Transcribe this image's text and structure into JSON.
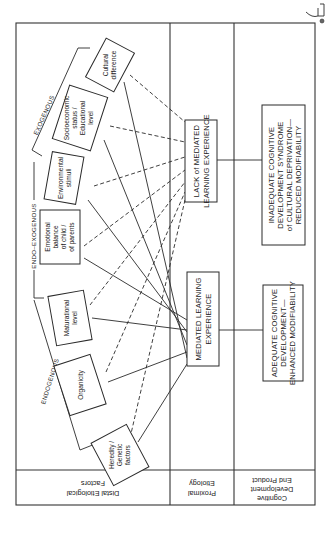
{
  "diagram": {
    "orientation": "rotated-90-clockwise",
    "row_headers": {
      "distal": "Distal Etiological Factors",
      "distal_line1": "Distal Etiological",
      "distal_line2": "Factors",
      "proximal_line1": "Proximal",
      "proximal_line2": "Etiology",
      "product_line1": "Cognitive",
      "product_line2": "Development",
      "product_line3": "End Product"
    },
    "groups": {
      "exogenous": "EXOGENOUS",
      "endo_exogenous": "ENDO–EXOGENOUS",
      "endogenous": "ENDOGENOUS"
    },
    "factors": [
      {
        "id": "cultural",
        "lines": [
          "Cultural",
          "difference"
        ],
        "group": "exogenous"
      },
      {
        "id": "socioeconomic",
        "lines": [
          "Socioeconomic",
          "status /",
          "Educational",
          "level"
        ],
        "group": "exogenous"
      },
      {
        "id": "environmental",
        "lines": [
          "Environmental",
          "stimuli"
        ],
        "group": "endo_exogenous"
      },
      {
        "id": "emotional",
        "lines": [
          "Emotional",
          "balance",
          "of child /",
          "of parents"
        ],
        "group": "endo_exogenous"
      },
      {
        "id": "maturational",
        "lines": [
          "Maturational",
          "level"
        ],
        "group": "endogenous"
      },
      {
        "id": "organicity",
        "lines": [
          "Organicity"
        ],
        "group": "endogenous"
      },
      {
        "id": "hereditary",
        "lines": [
          "Heredity /",
          "Genetic",
          "factors"
        ],
        "group": "endogenous"
      }
    ],
    "proximal": {
      "lack_mle": {
        "line1": "LACK of MEDIATED",
        "line2": "LEARNING EXPERIENCE"
      },
      "mle": {
        "line1": "MEDIATED LEARNING",
        "line2": "EXPERIENCE"
      }
    },
    "outcomes": {
      "inadequate": {
        "line1": "INADEQUATE COGNITIVE",
        "line2": "DEVELOPMENT SYNDROME",
        "line3": "of CULTURAL DEPRIVATION—",
        "line4": "REDUCED MODIFIABILITY"
      },
      "adequate": {
        "line1": "ADEQUATE COGNITIVE",
        "line2": "DEVELOPMENT—",
        "line3": "ENHANCED MODIFIABILITY"
      }
    },
    "connections": {
      "solid_to_mle": [
        "cultural",
        "socioeconomic",
        "environmental",
        "emotional",
        "maturational",
        "organicity",
        "hereditary"
      ],
      "dashed_to_lack_mle": [
        "cultural",
        "socioeconomic",
        "environmental",
        "emotional",
        "maturational",
        "organicity",
        "hereditary"
      ]
    },
    "colors": {
      "ink": "#2a2a2a",
      "paper": "#ffffff"
    }
  }
}
